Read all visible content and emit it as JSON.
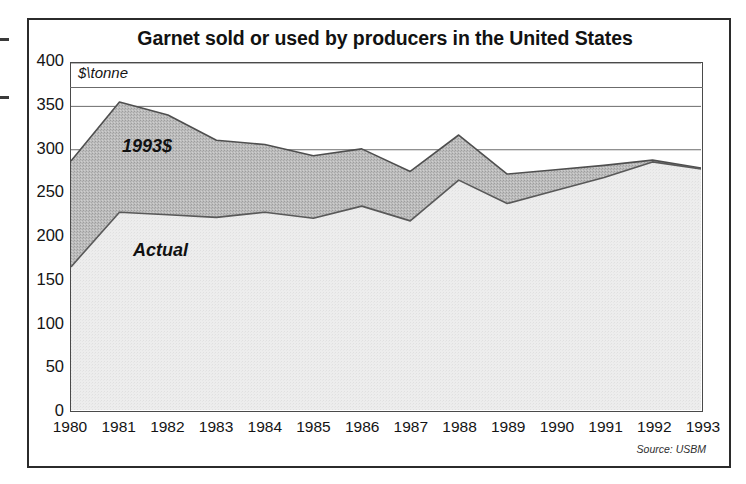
{
  "figure": {
    "title": "Garnet sold or used by producers in the United States",
    "unit_label": "$\\tonne",
    "source_note": "Source: USBM"
  },
  "chart_data": {
    "type": "area",
    "title": "Garnet sold or used by producers in the United States",
    "subtitle": "",
    "xlabel": "",
    "ylabel": "$\\tonne",
    "ylim": [
      0,
      400
    ],
    "ytick_step": 50,
    "yticks": [
      400,
      350,
      300,
      250,
      200,
      150,
      100,
      50,
      0
    ],
    "grid": true,
    "grid_axis": "y",
    "legend_position": "inline-annotations",
    "stacking": "overlaid",
    "categories": [
      1980,
      1981,
      1982,
      1983,
      1984,
      1985,
      1986,
      1987,
      1988,
      1989,
      1990,
      1991,
      1992,
      1993
    ],
    "xtick_labels": [
      "1980",
      "1981",
      "1982",
      "1983",
      "1984",
      "1985",
      "1986",
      "1987",
      "1988",
      "1989",
      "1990",
      "1991",
      "1992",
      "1993"
    ],
    "series": [
      {
        "name": "1993$",
        "label": "1993$",
        "color": "#b9b9b9",
        "line_color": "#4f4f4f",
        "values": [
          287,
          355,
          340,
          311,
          306,
          293,
          301,
          275,
          317,
          272,
          277,
          282,
          288,
          279
        ]
      },
      {
        "name": "Actual",
        "label": "Actual",
        "color": "#ececec",
        "line_color": "#595959",
        "values": [
          165,
          228,
          225,
          222,
          228,
          221,
          235,
          218,
          265,
          238,
          253,
          268,
          286,
          278
        ]
      }
    ],
    "annotations": [
      {
        "text": "1993$",
        "x": 1981.2,
        "y": 320
      },
      {
        "text": "Actual",
        "x": 1981.4,
        "y": 200
      },
      {
        "text": "$\\tonne",
        "x": 1980.0,
        "y": 392
      }
    ]
  },
  "axis": {
    "y_ticks": [
      {
        "label": "400",
        "value": 400
      },
      {
        "label": "350",
        "value": 350
      },
      {
        "label": "300",
        "value": 300
      },
      {
        "label": "250",
        "value": 250
      },
      {
        "label": "200",
        "value": 200
      },
      {
        "label": "150",
        "value": 150
      },
      {
        "label": "100",
        "value": 100
      },
      {
        "label": "50",
        "value": 50
      },
      {
        "label": "0",
        "value": 0
      }
    ],
    "x_ticks": [
      {
        "label": "1980"
      },
      {
        "label": "1981"
      },
      {
        "label": "1982"
      },
      {
        "label": "1983"
      },
      {
        "label": "1984"
      },
      {
        "label": "1985"
      },
      {
        "label": "1986"
      },
      {
        "label": "1987"
      },
      {
        "label": "1988"
      },
      {
        "label": "1989"
      },
      {
        "label": "1990"
      },
      {
        "label": "1991"
      },
      {
        "label": "1992"
      },
      {
        "label": "1993"
      }
    ]
  },
  "colors": {
    "series_real_fill": "#b9b9b9",
    "series_actual_fill": "#ececec",
    "series_line": "#4f4f4f",
    "grid_line": "#6b6b6b",
    "frame": "#2b2b2b",
    "text": "#141414"
  }
}
